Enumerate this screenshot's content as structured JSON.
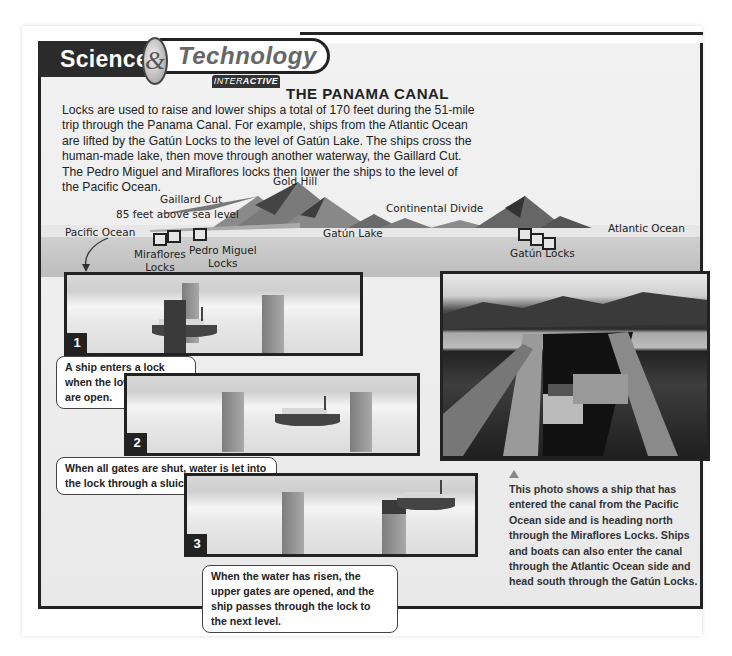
{
  "header": {
    "science_label": "Science",
    "ampersand": "&",
    "technology_label": "Technology",
    "interactive_prefix": "INTER",
    "interactive_suffix": "ACTIVE"
  },
  "article": {
    "title": "THE PANAMA CANAL",
    "intro": "Locks are used to raise and lower ships a total of 170 feet during the 51-mile trip through the Panama Canal. For example, ships from the Atlantic Ocean are lifted by the Gatún Locks to the level of Gatún Lake. The ships cross the human-made lake, then move through another waterway, the Gaillard Cut. The Pedro Miguel and Miraflores locks then lower the ships to the level of the Pacific Ocean."
  },
  "diagram": {
    "labels": {
      "gold_hill": "Gold Hill",
      "gaillard_cut": "Gaillard Cut",
      "gaillard_elevation": "85 feet above sea level",
      "pacific_ocean": "Pacific Ocean",
      "continental_divide": "Continental Divide",
      "gatun_lake": "Gatún Lake",
      "atlantic_ocean": "Atlantic Ocean",
      "miraflores_locks_line1": "Miraflores",
      "miraflores_locks_line2": "Locks",
      "pedro_miguel_line1": "Pedro Miguel",
      "pedro_miguel_line2": "Locks",
      "gatun_locks": "Gatún Locks"
    },
    "steps": [
      {
        "number": "1",
        "text": "A ship enters a lock when the lower gates are open."
      },
      {
        "number": "2",
        "text": "When all gates are shut, water is let into the lock through a sluice (small gate)."
      },
      {
        "number": "3",
        "text": "When the water has risen, the upper gates are opened, and the ship passes through the lock to the next level."
      }
    ]
  },
  "photo": {
    "caption": "This photo shows a ship that has entered the canal from the Pacific Ocean side and is heading north through the Miraflores Locks. Ships and boats can also enter the canal through the Atlantic Ocean side and head south through the Gatún Locks."
  },
  "colors": {
    "frame": "#222222",
    "panel_bg": "#e9e9e9",
    "banner_dark": "#2b2b2b"
  }
}
